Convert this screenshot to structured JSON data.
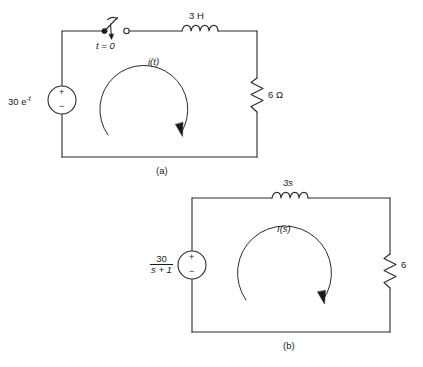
{
  "figure": {
    "type": "circuit-diagram",
    "background": "#ffffff",
    "line_color": "#2a2a2a",
    "text_color": "#1a1a1a",
    "circuits": [
      {
        "id": "a",
        "caption": "(a)",
        "domain": "time-domain",
        "source": {
          "kind": "voltage-source",
          "label_value": "30 e",
          "label_exponent": "-t",
          "plus_sign": "+",
          "minus_sign": "−"
        },
        "switch": {
          "label": "t = 0",
          "state": "open",
          "action": "closes"
        },
        "inductor": {
          "label": "3 H"
        },
        "resistor": {
          "label": "6 Ω"
        },
        "current": {
          "label": "i(t)",
          "direction": "clockwise"
        }
      },
      {
        "id": "b",
        "caption": "(b)",
        "domain": "s-domain",
        "source": {
          "kind": "voltage-source",
          "label_numerator": "30",
          "label_denominator": "s + 1",
          "plus_sign": "+",
          "minus_sign": "−"
        },
        "inductor": {
          "label": "3s"
        },
        "resistor": {
          "label": "6"
        },
        "current": {
          "label": "I(s)",
          "direction": "clockwise"
        }
      }
    ]
  }
}
